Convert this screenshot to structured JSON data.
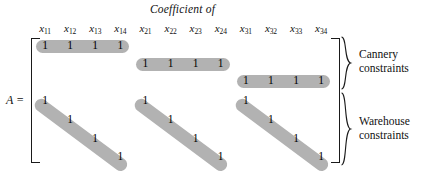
{
  "figure": {
    "title": "Coefficient of",
    "matrix_label": "A =",
    "entry_value": "1",
    "colors": {
      "capsule_gray": "#b2b2b2",
      "ink": "#1a1a1a",
      "background": "#ffffff"
    }
  },
  "columns": [
    {
      "label": "x",
      "sub": "11"
    },
    {
      "label": "x",
      "sub": "12"
    },
    {
      "label": "x",
      "sub": "13"
    },
    {
      "label": "x",
      "sub": "14"
    },
    {
      "label": "x",
      "sub": "21"
    },
    {
      "label": "x",
      "sub": "22"
    },
    {
      "label": "x",
      "sub": "23"
    },
    {
      "label": "x",
      "sub": "24"
    },
    {
      "label": "x",
      "sub": "31"
    },
    {
      "label": "x",
      "sub": "32"
    },
    {
      "label": "x",
      "sub": "33"
    },
    {
      "label": "x",
      "sub": "34"
    }
  ],
  "groups": [
    {
      "name": "cannery",
      "label_line1": "Cannery",
      "label_line2": "constraints"
    },
    {
      "name": "warehouse",
      "label_line1": "Warehouse",
      "label_line2": "constraints"
    }
  ],
  "rows": {
    "cannery": [
      {
        "orientation": "horizontal",
        "columns": [
          1,
          2,
          3,
          4
        ]
      },
      {
        "orientation": "horizontal",
        "columns": [
          5,
          6,
          7,
          8
        ]
      },
      {
        "orientation": "horizontal",
        "columns": [
          9,
          10,
          11,
          12
        ]
      }
    ],
    "warehouse": [
      {
        "orientation": "diagonal",
        "columns": [
          1,
          5,
          9
        ]
      },
      {
        "orientation": "diagonal",
        "columns": [
          2,
          6,
          10
        ]
      },
      {
        "orientation": "diagonal",
        "columns": [
          3,
          7,
          11
        ]
      },
      {
        "orientation": "diagonal",
        "columns": [
          4,
          8,
          12
        ]
      }
    ]
  }
}
